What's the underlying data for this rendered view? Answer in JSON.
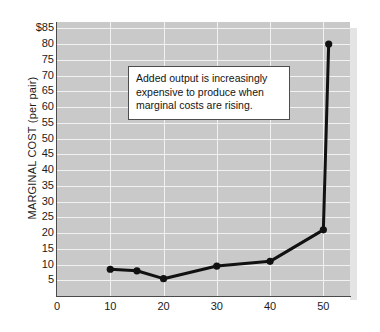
{
  "chart_data": {
    "type": "line",
    "title": "",
    "xlabel": "",
    "ylabel": "MARGINAL COST (per pair)",
    "xlim": [
      0,
      55
    ],
    "ylim": [
      0,
      87
    ],
    "grid": true,
    "legend": "none",
    "y_tick_labels": [
      "$85",
      "80",
      "75",
      "70",
      "65",
      "60",
      "55",
      "50",
      "45",
      "40",
      "35",
      "30",
      "25",
      "20",
      "15",
      "10",
      "5"
    ],
    "y_tick_values": [
      85,
      80,
      75,
      70,
      65,
      60,
      55,
      50,
      45,
      40,
      35,
      30,
      25,
      20,
      15,
      10,
      5
    ],
    "x_tick_labels": [
      "0",
      "10",
      "20",
      "30",
      "40",
      "50"
    ],
    "x_tick_values": [
      0,
      10,
      20,
      30,
      40,
      50
    ],
    "series": [
      {
        "name": "Marginal cost",
        "color": "#111111",
        "marker": "circle",
        "x": [
          10,
          15,
          20,
          30,
          40,
          50,
          51
        ],
        "y": [
          8.5,
          8,
          5.5,
          9.5,
          11,
          21,
          80
        ]
      }
    ],
    "annotations": [
      {
        "text": "Added output is increasingly expensive to produce when marginal costs are rising.",
        "line1": "Added output is increasingly",
        "line2": "expensive to produce when",
        "line3": "marginal costs are rising."
      }
    ]
  },
  "colors": {
    "plot_background": "#c9c9c9",
    "gridline": "#f2f2f2",
    "axis": "#4a4a4a",
    "series": "#111111",
    "annotation_background": "#ffffff",
    "annotation_border": "#4d4d4d",
    "text": "#1b1b1b"
  }
}
